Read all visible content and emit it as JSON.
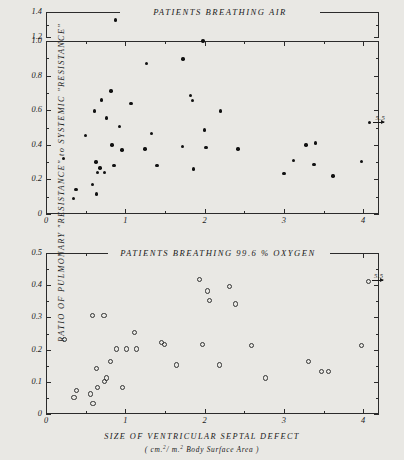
{
  "figure": {
    "y_axis_title": "RATIO OF PULMONARY \"RESISTANCE\" to SYSTEMIC \"RESISTANCE\"",
    "x_axis_title": "SIZE OF VENTRICULAR SEPTAL DEFECT",
    "x_axis_units_prefix": "( cm.",
    "x_axis_units_mid": "/ m.",
    "x_axis_units_suffix": " Body Surface Area )",
    "x_axis_units_sup": "2",
    "background_color": "#e9e8e4",
    "ink_color": "#1a1a1a"
  },
  "chart_data": [
    {
      "type": "scatter",
      "title": "PATIENTS  BREATHING  AIR",
      "xlabel": "SIZE OF VENTRICULAR SEPTAL DEFECT (cm.2 / m.2 Body Surface Area)",
      "ylabel": "RATIO OF PULMONARY \"RESISTANCE\" to SYSTEMIC \"RESISTANCE\"",
      "marker": "filled-circle",
      "grid": false,
      "legend": "none",
      "xlim": [
        0,
        4.2
      ],
      "ylim": [
        0,
        1.0
      ],
      "ylim_break_upper": [
        1.2,
        1.4
      ],
      "axis_break": true,
      "xticks": [
        0,
        1,
        2,
        3,
        4
      ],
      "xtick_labels": [
        "0",
        "1",
        "2",
        "3",
        "4"
      ],
      "xminor_step": 0.5,
      "yticks": [
        0,
        0.2,
        0.4,
        0.6,
        0.8,
        1.0
      ],
      "ytick_labels": [
        "0",
        "0.2",
        "0.4",
        "0.6",
        "0.8",
        "1.0"
      ],
      "yticks_upper": [
        1.2,
        1.4
      ],
      "ytick_labels_upper": [
        "1.2",
        "1.4"
      ],
      "yminor_step": 0.1,
      "annotations": [
        {
          "text": "5.5",
          "x": 4.08,
          "y": 0.53,
          "arrow": "right",
          "meaning": "point lies off-scale at x = 5.5"
        }
      ],
      "points": [
        {
          "x": 0.22,
          "y": 0.32
        },
        {
          "x": 0.35,
          "y": 0.09
        },
        {
          "x": 0.38,
          "y": 0.14
        },
        {
          "x": 0.5,
          "y": 0.455
        },
        {
          "x": 0.59,
          "y": 0.17
        },
        {
          "x": 0.61,
          "y": 0.595
        },
        {
          "x": 0.63,
          "y": 0.3
        },
        {
          "x": 0.64,
          "y": 0.115
        },
        {
          "x": 0.65,
          "y": 0.24
        },
        {
          "x": 0.68,
          "y": 0.265
        },
        {
          "x": 0.7,
          "y": 0.66
        },
        {
          "x": 0.74,
          "y": 0.24
        },
        {
          "x": 0.76,
          "y": 0.555
        },
        {
          "x": 0.82,
          "y": 0.71
        },
        {
          "x": 0.83,
          "y": 0.4
        },
        {
          "x": 0.86,
          "y": 0.28
        },
        {
          "x": 0.88,
          "y": 1.335
        },
        {
          "x": 0.93,
          "y": 0.505
        },
        {
          "x": 0.96,
          "y": 0.37
        },
        {
          "x": 1.07,
          "y": 0.64
        },
        {
          "x": 1.25,
          "y": 0.375
        },
        {
          "x": 1.27,
          "y": 0.87
        },
        {
          "x": 1.33,
          "y": 0.465
        },
        {
          "x": 1.4,
          "y": 0.28
        },
        {
          "x": 1.72,
          "y": 0.39
        },
        {
          "x": 1.73,
          "y": 0.895
        },
        {
          "x": 1.82,
          "y": 0.685
        },
        {
          "x": 1.85,
          "y": 0.655
        },
        {
          "x": 1.86,
          "y": 0.26
        },
        {
          "x": 1.98,
          "y": 1.0
        },
        {
          "x": 2.0,
          "y": 0.485
        },
        {
          "x": 2.02,
          "y": 0.385
        },
        {
          "x": 2.2,
          "y": 0.595
        },
        {
          "x": 2.42,
          "y": 0.375
        },
        {
          "x": 3.0,
          "y": 0.235
        },
        {
          "x": 3.12,
          "y": 0.31
        },
        {
          "x": 3.28,
          "y": 0.4
        },
        {
          "x": 3.4,
          "y": 0.41
        },
        {
          "x": 3.38,
          "y": 0.285
        },
        {
          "x": 3.62,
          "y": 0.22
        },
        {
          "x": 3.98,
          "y": 0.305
        },
        {
          "x": 4.08,
          "y": 0.53
        }
      ]
    },
    {
      "type": "scatter",
      "title": "PATIENTS  BREATHING  99.6 %  OXYGEN",
      "xlabel": "SIZE OF VENTRICULAR SEPTAL DEFECT (cm.2 / m.2 Body Surface Area)",
      "ylabel": "RATIO OF PULMONARY \"RESISTANCE\" to SYSTEMIC \"RESISTANCE\"",
      "marker": "open-circle",
      "grid": false,
      "legend": "none",
      "xlim": [
        0,
        4.2
      ],
      "ylim": [
        0,
        0.5
      ],
      "xticks": [
        0,
        1,
        2,
        3,
        4
      ],
      "xtick_labels": [
        "0",
        "1",
        "2",
        "3",
        "4"
      ],
      "xminor_step": 0.5,
      "yticks": [
        0,
        0.1,
        0.2,
        0.3,
        0.4,
        0.5
      ],
      "ytick_labels": [
        "0",
        "0.1",
        "0.2",
        "0.3",
        "0.4",
        "0.5"
      ],
      "yminor_step": 0.05,
      "annotations": [
        {
          "text": "5.5",
          "x": 4.06,
          "y": 0.415,
          "arrow": "right",
          "meaning": "point lies off-scale at x = 5.5"
        }
      ],
      "points": [
        {
          "x": 0.22,
          "y": 0.235
        },
        {
          "x": 0.34,
          "y": 0.055
        },
        {
          "x": 0.37,
          "y": 0.075
        },
        {
          "x": 0.55,
          "y": 0.065
        },
        {
          "x": 0.57,
          "y": 0.31
        },
        {
          "x": 0.58,
          "y": 0.035
        },
        {
          "x": 0.62,
          "y": 0.145
        },
        {
          "x": 0.64,
          "y": 0.085
        },
        {
          "x": 0.72,
          "y": 0.31
        },
        {
          "x": 0.73,
          "y": 0.105
        },
        {
          "x": 0.75,
          "y": 0.115
        },
        {
          "x": 0.8,
          "y": 0.165
        },
        {
          "x": 0.88,
          "y": 0.205
        },
        {
          "x": 0.95,
          "y": 0.085
        },
        {
          "x": 1.0,
          "y": 0.205
        },
        {
          "x": 1.1,
          "y": 0.255
        },
        {
          "x": 1.13,
          "y": 0.205
        },
        {
          "x": 1.44,
          "y": 0.225
        },
        {
          "x": 1.48,
          "y": 0.22
        },
        {
          "x": 1.63,
          "y": 0.155
        },
        {
          "x": 1.92,
          "y": 0.42
        },
        {
          "x": 1.96,
          "y": 0.22
        },
        {
          "x": 2.02,
          "y": 0.385
        },
        {
          "x": 2.05,
          "y": 0.355
        },
        {
          "x": 2.18,
          "y": 0.155
        },
        {
          "x": 2.3,
          "y": 0.4
        },
        {
          "x": 2.38,
          "y": 0.345
        },
        {
          "x": 2.58,
          "y": 0.215
        },
        {
          "x": 2.76,
          "y": 0.115
        },
        {
          "x": 3.3,
          "y": 0.165
        },
        {
          "x": 3.46,
          "y": 0.135
        },
        {
          "x": 3.55,
          "y": 0.135
        },
        {
          "x": 3.97,
          "y": 0.215
        },
        {
          "x": 4.06,
          "y": 0.415
        }
      ]
    }
  ]
}
